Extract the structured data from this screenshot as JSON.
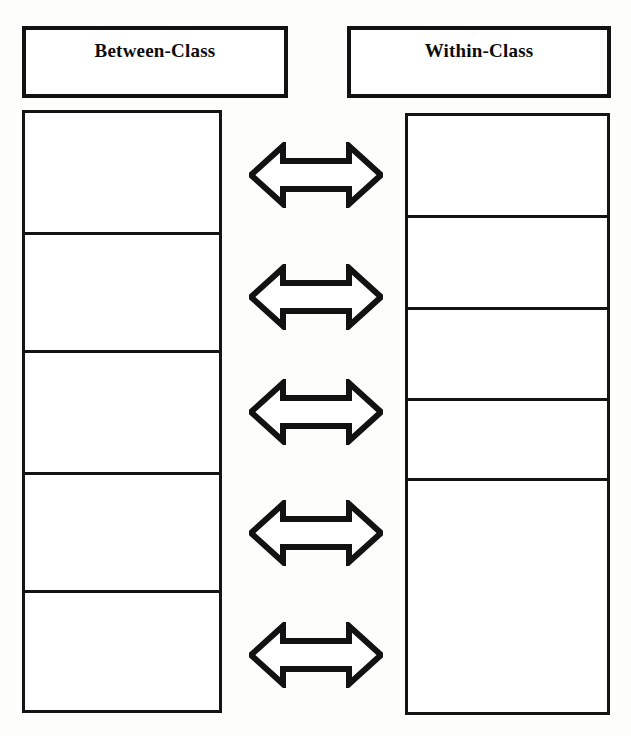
{
  "document": {
    "kind": "two-column-comparison-diagram",
    "background_color": "#fdfdfc",
    "ink_color": "#121212"
  },
  "headers": {
    "left": {
      "label": "Between-Class",
      "icon": "none"
    },
    "right": {
      "label": "Within-Class",
      "icon": "none"
    }
  },
  "columns": {
    "left": {
      "title": "Between-Class",
      "cells": [
        {
          "text": ""
        },
        {
          "text": ""
        },
        {
          "text": ""
        },
        {
          "text": ""
        },
        {
          "text": ""
        }
      ]
    },
    "right": {
      "title": "Within-Class",
      "cells": [
        {
          "text": ""
        },
        {
          "text": ""
        },
        {
          "text": ""
        },
        {
          "text": ""
        },
        {
          "text": ""
        }
      ]
    }
  },
  "connectors": [
    {
      "icon": "double-headed-arrow-icon",
      "direction": "bidirectional",
      "label": ""
    },
    {
      "icon": "double-headed-arrow-icon",
      "direction": "bidirectional",
      "label": ""
    },
    {
      "icon": "double-headed-arrow-icon",
      "direction": "bidirectional",
      "label": ""
    },
    {
      "icon": "double-headed-arrow-icon",
      "direction": "bidirectional",
      "label": ""
    },
    {
      "icon": "double-headed-arrow-icon",
      "direction": "bidirectional",
      "label": ""
    }
  ]
}
